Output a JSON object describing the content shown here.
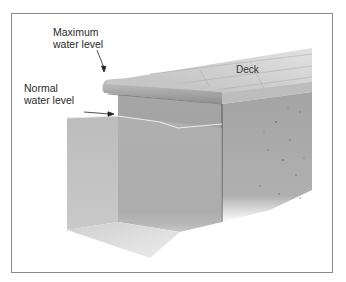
{
  "figure": {
    "labels": {
      "max_line1": "Maximum",
      "max_line2": "water level",
      "normal_line1": "Normal",
      "normal_line2": "water level",
      "deck": "Deck"
    },
    "colors": {
      "frame_border": "#8a8a8a",
      "coping": "#a9a9a9",
      "tile_wall": "#b4b4b4",
      "concrete": "#a2a2a2",
      "water": "#c4c4c4",
      "deck": "#c9c9c9",
      "text": "#2a2a2a"
    }
  }
}
